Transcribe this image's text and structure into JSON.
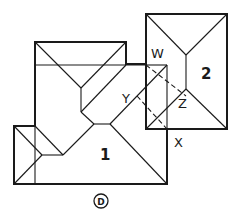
{
  "diagram": {
    "figure_label": "D",
    "sections": [
      {
        "id": "section-1",
        "label": "1"
      },
      {
        "id": "section-2",
        "label": "2"
      }
    ],
    "points": [
      {
        "id": "W",
        "label": "W"
      },
      {
        "id": "X",
        "label": "X"
      },
      {
        "id": "Y",
        "label": "Y"
      },
      {
        "id": "Z",
        "label": "Z"
      }
    ],
    "colors": {
      "line": "#1a1a1a",
      "background": "#ffffff"
    }
  }
}
